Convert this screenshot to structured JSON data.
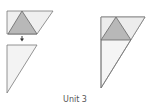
{
  "caption": "Unit 3",
  "colors": {
    "outline": "#7a7a7a",
    "light_fill": "#efefef",
    "dark_fill": "#b8b8b8",
    "arrow": "#333333"
  },
  "figures": [
    {
      "name": "left-parallelogram-with-triangle",
      "description": "parallelogram with shaded inner triangle"
    },
    {
      "name": "left-cut-triangle",
      "description": "right triangle moved below"
    },
    {
      "name": "right-composite-triangle",
      "description": "large right triangle containing shaded triangle"
    }
  ]
}
